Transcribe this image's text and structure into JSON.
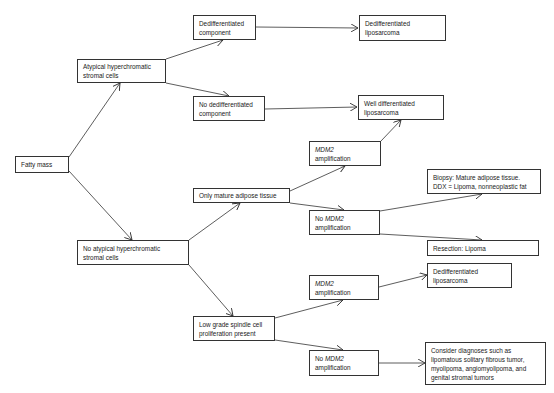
{
  "diagram": {
    "type": "flowchart",
    "nodes": {
      "fatty_mass": {
        "lines": [
          "Fatty mass"
        ]
      },
      "atypical": {
        "lines": [
          "Atypical hyperchromatic",
          "stromal cells"
        ]
      },
      "no_atypical": {
        "lines": [
          "No atypical hyperchromatic",
          "stromal cells"
        ]
      },
      "dediff_component": {
        "lines": [
          "Dedifferentiated",
          "component"
        ]
      },
      "no_dediff_component": {
        "lines": [
          "No dedifferentiated",
          "component"
        ]
      },
      "dediff_lipo_top": {
        "lines": [
          "Dedifferentiated",
          "liposarcoma"
        ]
      },
      "well_diff_lipo": {
        "lines": [
          "Well differentiated",
          "liposarcoma"
        ]
      },
      "only_mature": {
        "lines": [
          "Only mature adipose tissue"
        ]
      },
      "mdm2_amp_top": {
        "italic": "MDM2",
        "line2": "amplification"
      },
      "no_mdm2_mid": {
        "prefix": "No ",
        "italic": "MDM2",
        "line2": "amplification"
      },
      "biopsy": {
        "lines": [
          "Biopsy: Mature adipose tissue.",
          "DDX = Lipoma, nonneoplastic fat"
        ]
      },
      "resection": {
        "lines": [
          "Resection: Lipoma"
        ]
      },
      "low_grade": {
        "lines": [
          "Low grade spindle cell",
          "proliferation present"
        ]
      },
      "mdm2_amp_low": {
        "italic": "MDM2",
        "line2": "amplification"
      },
      "dediff_lipo_low": {
        "lines": [
          "Dedifferentiated",
          "liposarcoma"
        ]
      },
      "no_mdm2_low": {
        "prefix": "No ",
        "italic": "MDM2",
        "line2": "amplification"
      },
      "consider": {
        "lines": [
          "Consider diagnoses such as",
          "lipomatous solitary fibrous tumor,",
          "myolipoma, angiomyolipoma,  and",
          "genital stromal tumors"
        ]
      }
    },
    "edges": [
      [
        "fatty_mass",
        "atypical"
      ],
      [
        "fatty_mass",
        "no_atypical"
      ],
      [
        "atypical",
        "dediff_component"
      ],
      [
        "atypical",
        "no_dediff_component"
      ],
      [
        "dediff_component",
        "dediff_lipo_top"
      ],
      [
        "no_dediff_component",
        "well_diff_lipo"
      ],
      [
        "no_atypical",
        "only_mature"
      ],
      [
        "no_atypical",
        "low_grade"
      ],
      [
        "only_mature",
        "mdm2_amp_top"
      ],
      [
        "only_mature",
        "no_mdm2_mid"
      ],
      [
        "mdm2_amp_top",
        "well_diff_lipo"
      ],
      [
        "no_mdm2_mid",
        "biopsy"
      ],
      [
        "no_mdm2_mid",
        "resection"
      ],
      [
        "low_grade",
        "mdm2_amp_low"
      ],
      [
        "low_grade",
        "no_mdm2_low"
      ],
      [
        "mdm2_amp_low",
        "dediff_lipo_low"
      ],
      [
        "no_mdm2_low",
        "consider"
      ]
    ]
  }
}
